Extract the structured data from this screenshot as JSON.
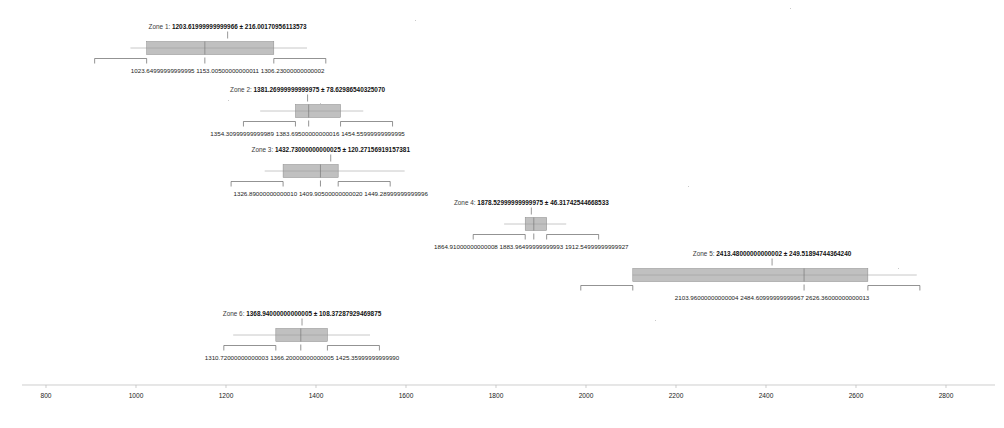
{
  "figure": {
    "background": "#ffffff",
    "accent": "#9a9a9a",
    "text_color": "#222222"
  },
  "chart_data": {
    "type": "bar",
    "title": "",
    "xlabel": "",
    "ylabel": "",
    "xlim": [
      700,
      2900
    ],
    "grid": false,
    "legend": false,
    "orientation": "horizontal",
    "categories": [
      "Zone 1",
      "Zone 2",
      "Zone 3",
      "Zone 4",
      "Zone 5",
      "Zone 6"
    ],
    "values": [
      1203.6199999999997,
      1381.2699999999998,
      1432.7300000000002,
      1878.5299999999997,
      2413.48,
      1368.94
    ],
    "errors": [
      216.00170956113573,
      78.6298654032507,
      120.2715691915738,
      46.31742544668533,
      249.5189474436424,
      108.37287929469875
    ],
    "axis": {
      "ticks": [
        800,
        1000,
        1200,
        1400,
        1600,
        1800,
        2000,
        2200,
        2400,
        2600,
        2800
      ],
      "tick_labels": [
        "800",
        "1000",
        "1200",
        "1400",
        "1600",
        "1800",
        "2000",
        "2200",
        "2400",
        "2600",
        "2800"
      ]
    },
    "series": [
      {
        "name": "Zone 1",
        "label_prefix": "Zone 1:",
        "center": 1203.6199999999997,
        "center_text": "1203.61999999999966",
        "spread": 216.00170956113573,
        "spread_text": "216.00170956113573",
        "title": "Zone 1: 1203.61999999999966 ± 216.00170956113573",
        "box_low": 1023.65,
        "box_high": 1306.23,
        "median": 1153.005,
        "whisker_low": 987.65,
        "whisker_high": 1380.0,
        "marks": [
          {
            "value": 1023.65,
            "text": "1023.64999999999995"
          },
          {
            "value": 1153.005,
            "text": "1153.00500000000011"
          },
          {
            "value": 1306.23,
            "text": "1306.23000000000002"
          }
        ]
      },
      {
        "name": "Zone 2",
        "label_prefix": "Zone 2:",
        "center": 1381.2699999999998,
        "center_text": "1381.26999999999975",
        "spread": 78.6298654032507,
        "spread_text": "78.62986540325070",
        "title": "Zone 2: 1381.26999999999975 ± 78.62986540325070",
        "box_low": 1354.31,
        "box_high": 1454.56,
        "median": 1383.6950000000002,
        "whisker_low": 1276.0,
        "whisker_high": 1505.0,
        "marks": [
          {
            "value": 1354.31,
            "text": "1354.30999999999989"
          },
          {
            "value": 1383.6950000000002,
            "text": "1383.69500000000016"
          },
          {
            "value": 1454.56,
            "text": "1454.55999999999995"
          }
        ]
      },
      {
        "name": "Zone 3",
        "label_prefix": "Zone 3:",
        "center": 1432.7300000000002,
        "center_text": "1432.73000000000025",
        "spread": 120.2715691915738,
        "spread_text": "120.27156919157381",
        "title": "Zone 3: 1432.73000000000025 ± 120.27156919157381",
        "box_low": 1326.89,
        "box_high": 1449.29,
        "median": 1409.9050000000002,
        "whisker_low": 1286.0,
        "whisker_high": 1597.0,
        "marks": [
          {
            "value": 1326.89,
            "text": "1326.89000000000010"
          },
          {
            "value": 1409.9050000000002,
            "text": "1409.90500000000020"
          },
          {
            "value": 1449.29,
            "text": "1449.28999999999996"
          }
        ]
      },
      {
        "name": "Zone 4",
        "label_prefix": "Zone 4:",
        "center": 1878.5299999999997,
        "center_text": "1878.52999999999975",
        "spread": 46.31742544668533,
        "spread_text": "46.31742544668533",
        "title": "Zone 4: 1878.52999999999975 ± 46.31742544668533",
        "box_low": 1864.91,
        "box_high": 1912.5499999999993,
        "median": 1883.965,
        "whisker_low": 1818.0,
        "whisker_high": 1956.0,
        "marks": [
          {
            "value": 1864.91,
            "text": "1864.91000000000008"
          },
          {
            "value": 1883.965,
            "text": "1883.96499999999993"
          },
          {
            "value": 1912.5499999999993,
            "text": "1912.54999999999927"
          }
        ]
      },
      {
        "name": "Zone 5",
        "label_prefix": "Zone 5:",
        "center": 2413.48,
        "center_text": "2413.48000000000002",
        "spread": 249.5189474436424,
        "spread_text": "249.51894744364240",
        "title": "Zone 5: 2413.48000000000002 ± 249.51894744364240",
        "box_low": 2103.96,
        "box_high": 2626.36,
        "median": 2484.6099999999997,
        "whisker_low": 2103.96,
        "whisker_high": 2735.0,
        "marks": [
          {
            "value": 2103.96,
            "text": "2103.96000000000004"
          },
          {
            "value": 2484.6099999999997,
            "text": "2484.60999999999967"
          },
          {
            "value": 2626.36,
            "text": "2626.36000000000013"
          }
        ]
      },
      {
        "name": "Zone 6",
        "label_prefix": "Zone 6:",
        "center": 1368.94,
        "center_text": "1368.94000000000005",
        "spread": 108.37287929469875,
        "spread_text": "108.37287929469875",
        "title": "Zone 6: 1368.94000000000005 ± 108.37287929469875",
        "box_low": 1310.72,
        "box_high": 1425.36,
        "median": 1366.2,
        "whisker_low": 1216.0,
        "whisker_high": 1520.0,
        "marks": [
          {
            "value": 1310.72,
            "text": "1310.72000000000003"
          },
          {
            "value": 1366.2,
            "text": "1366.20000000000005"
          },
          {
            "value": 1425.36,
            "text": "1425.35999999999990"
          }
        ]
      }
    ]
  }
}
